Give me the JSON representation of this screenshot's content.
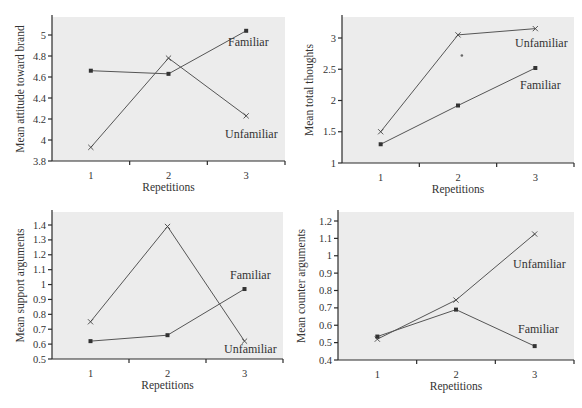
{
  "figure": {
    "background": "#ffffff",
    "panel_fill": "#ececec",
    "line_color": "#555555"
  },
  "chart_data": [
    {
      "id": "attitude",
      "type": "line",
      "title": "",
      "xlabel": "Repetitions",
      "ylabel": "Mean attitude toward brand",
      "categories": [
        "1",
        "2",
        "3"
      ],
      "ylim": [
        3.8,
        5.2
      ],
      "yticks": [
        3.8,
        4,
        4.2,
        4.4,
        4.6,
        4.8,
        5
      ],
      "ytick_labels": [
        "3.8",
        "4",
        "4.2",
        "4.4",
        "4.6",
        "4.8",
        "5"
      ],
      "grid": false,
      "legend": "inline labels",
      "series": [
        {
          "name": "Familiar",
          "marker": "dot",
          "values": [
            4.66,
            4.63,
            5.04
          ],
          "label_pos": [
            228,
            46
          ]
        },
        {
          "name": "Unfamiliar",
          "marker": "x",
          "values": [
            3.93,
            4.78,
            4.23
          ],
          "label_pos": [
            225,
            138
          ]
        }
      ],
      "annotations": []
    },
    {
      "id": "thoughts",
      "type": "line",
      "title": "",
      "xlabel": "Repetitions",
      "ylabel": "Mean total thoughts",
      "categories": [
        "1",
        "2",
        "3"
      ],
      "ylim": [
        1,
        3.3
      ],
      "yticks": [
        1,
        1.5,
        2,
        2.5,
        3
      ],
      "ytick_labels": [
        "1",
        "1.5",
        "2",
        "2.5",
        "3"
      ],
      "grid": false,
      "legend": "inline labels",
      "series": [
        {
          "name": "Unfamiliar",
          "marker": "x",
          "values": [
            1.5,
            3.05,
            3.15
          ],
          "label_pos": [
            515,
            47
          ]
        },
        {
          "name": "Familiar",
          "marker": "dot",
          "values": [
            1.3,
            1.92,
            2.52
          ],
          "label_pos": [
            520,
            89
          ]
        }
      ],
      "annotations": [
        {
          "text": "*",
          "x": 2.05,
          "y": 2.72
        }
      ]
    },
    {
      "id": "support",
      "type": "line",
      "title": "",
      "xlabel": "Repetitions",
      "ylabel": "Mean support arguments",
      "categories": [
        "1",
        "2",
        "3"
      ],
      "ylim": [
        0.5,
        1.45
      ],
      "yticks": [
        0.5,
        0.6,
        0.7,
        0.8,
        0.9,
        1,
        1.1,
        1.2,
        1.3,
        1.4
      ],
      "ytick_labels": [
        "0.5",
        "0.6",
        "0.7",
        "0.8",
        "0.9",
        "1",
        "1.1",
        "1.2",
        "1.3",
        "1.4"
      ],
      "grid": false,
      "legend": "inline labels",
      "series": [
        {
          "name": "Familiar",
          "marker": "dot",
          "values": [
            0.62,
            0.66,
            0.97
          ],
          "label_pos": [
            230,
            279
          ]
        },
        {
          "name": "Unfamiliar",
          "marker": "x",
          "values": [
            0.75,
            1.39,
            0.62
          ],
          "label_pos": [
            224,
            353
          ]
        }
      ],
      "annotations": []
    },
    {
      "id": "counter",
      "type": "line",
      "title": "",
      "xlabel": "Repetitions",
      "ylabel": "Mean counter arguments",
      "categories": [
        "1",
        "2",
        "3"
      ],
      "ylim": [
        0.4,
        1.24
      ],
      "yticks": [
        0.4,
        0.5,
        0.6,
        0.7,
        0.8,
        0.9,
        1,
        1.1,
        1.2
      ],
      "ytick_labels": [
        "0.4",
        "0.5",
        "0.6",
        "0.7",
        "0.8",
        "0.9",
        "1",
        "1.1",
        "1.2"
      ],
      "grid": false,
      "legend": "inline labels",
      "series": [
        {
          "name": "Unfamiliar",
          "marker": "x",
          "values": [
            0.52,
            0.745,
            1.125
          ],
          "label_pos": [
            513,
            268
          ]
        },
        {
          "name": "Familiar",
          "marker": "dot",
          "values": [
            0.535,
            0.69,
            0.48
          ],
          "label_pos": [
            518,
            333
          ]
        }
      ],
      "annotations": []
    }
  ],
  "layout": {
    "panels": [
      {
        "x0": 52,
        "y0": 17,
        "x1": 285,
        "y1": 161,
        "ylabel_x": 24
      },
      {
        "x0": 342,
        "y0": 17,
        "x1": 574,
        "y1": 163,
        "ylabel_x": 313
      },
      {
        "x0": 52,
        "y0": 212,
        "x1": 283,
        "y1": 359,
        "ylabel_x": 24
      },
      {
        "x0": 338,
        "y0": 212,
        "x1": 574,
        "y1": 360,
        "ylabel_x": 305
      }
    ]
  }
}
